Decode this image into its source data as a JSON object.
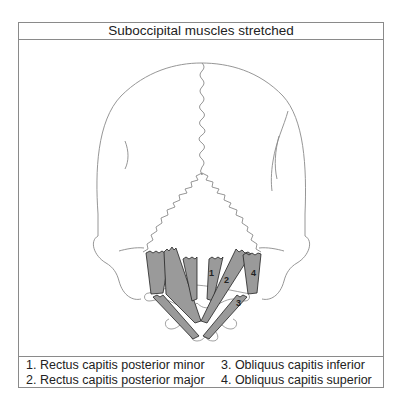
{
  "figure": {
    "title": "Suboccipital muscles stretched",
    "muscle_fill_color": "#9a9a9a",
    "outline_color": "#8a8a8a",
    "muscle_labels": [
      "1",
      "2",
      "3",
      "4"
    ]
  },
  "legend": {
    "items": [
      {
        "number": "1",
        "text": "1. Rectus capitis posterior minor"
      },
      {
        "number": "2",
        "text": "2. Rectus capitis posterior major"
      },
      {
        "number": "3",
        "text": "3. Obliquus capitis inferior"
      },
      {
        "number": "4",
        "text": "4. Obliquus capitis superior"
      }
    ]
  }
}
